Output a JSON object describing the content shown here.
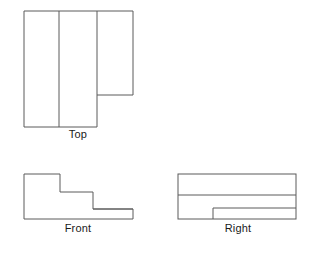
{
  "drawing": {
    "title": "Orthographic Multiview Projection",
    "stroke_color": "#5a5a5a",
    "stroke_width": 1,
    "background_color": "#ffffff",
    "label_color": "#1a1a1a",
    "views": [
      {
        "id": "top",
        "label": "Top",
        "description": "Top view: large rectangle with an offset rectangle extending to the right at the upper portion, divided by two internal vertical lines",
        "outline": [
          [
            24,
            11
          ],
          [
            133,
            11
          ],
          [
            133,
            95
          ],
          [
            97,
            95
          ],
          [
            97,
            127
          ],
          [
            24,
            127
          ]
        ],
        "internal_lines": [
          {
            "name": "vertical-divider-1",
            "from": [
              59,
              11
            ],
            "to": [
              59,
              127
            ]
          },
          {
            "name": "vertical-divider-2",
            "from": [
              97,
              11
            ],
            "to": [
              97,
              95
            ]
          }
        ]
      },
      {
        "id": "front",
        "label": "Front",
        "description": "Front view: stepped L-shaped profile descending left to right in two steps, with a low flange at the right",
        "outline": [
          [
            24,
            174
          ],
          [
            60,
            174
          ],
          [
            60,
            192
          ],
          [
            93,
            192
          ],
          [
            93,
            209
          ],
          [
            133,
            209
          ],
          [
            133,
            219
          ],
          [
            24,
            219
          ]
        ],
        "internal_lines": [
          {
            "name": "flange-top-edge",
            "from": [
              93,
              209
            ],
            "to": [
              133,
              209
            ]
          }
        ]
      },
      {
        "id": "right",
        "label": "Right",
        "description": "Right side view: full rectangle with a horizontal division near the top and an inner notch rectangle along the lower right",
        "outline": [
          [
            178,
            174
          ],
          [
            296,
            174
          ],
          [
            296,
            219
          ],
          [
            178,
            219
          ]
        ],
        "internal_lines": [
          {
            "name": "horizontal-divider",
            "from": [
              178,
              195
            ],
            "to": [
              296,
              195
            ]
          },
          {
            "name": "notch-top-edge",
            "from": [
              213,
              208
            ],
            "to": [
              296,
              208
            ]
          },
          {
            "name": "notch-left-edge",
            "from": [
              213,
              208
            ],
            "to": [
              213,
              219
            ]
          }
        ]
      }
    ]
  }
}
